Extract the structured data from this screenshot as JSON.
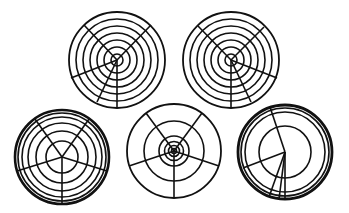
{
  "figure": {
    "stroke_color": "#111111",
    "background": "#ffffff"
  },
  "diagrams": [
    {
      "id": "top-left",
      "cx": 117,
      "cy": 60,
      "rings": [
        {
          "r": 6,
          "w": 1.6
        },
        {
          "r": 13,
          "w": 1.6
        },
        {
          "r": 20,
          "w": 1.6
        },
        {
          "r": 27,
          "w": 1.6
        },
        {
          "r": 34,
          "w": 1.6
        },
        {
          "r": 41,
          "w": 1.6
        },
        {
          "r": 48,
          "w": 1.8
        }
      ],
      "spokes": [
        {
          "x": 84,
          "y": 25
        },
        {
          "x": 151,
          "y": 25
        },
        {
          "x": 71,
          "y": 78
        },
        {
          "x": 97,
          "y": 102
        },
        {
          "x": 117,
          "y": 108
        }
      ],
      "spoke_width": 1.6
    },
    {
      "id": "top-right",
      "cx": 231,
      "cy": 60,
      "rings": [
        {
          "r": 6,
          "w": 1.6
        },
        {
          "r": 13,
          "w": 1.6
        },
        {
          "r": 20,
          "w": 1.6
        },
        {
          "r": 27,
          "w": 1.6
        },
        {
          "r": 34,
          "w": 1.6
        },
        {
          "r": 41,
          "w": 1.6
        },
        {
          "r": 48,
          "w": 1.8
        }
      ],
      "spokes": [
        {
          "x": 198,
          "y": 26
        },
        {
          "x": 264,
          "y": 27
        },
        {
          "x": 277,
          "y": 78
        },
        {
          "x": 251,
          "y": 102
        },
        {
          "x": 231,
          "y": 108
        }
      ],
      "spoke_width": 1.6
    },
    {
      "id": "bottom-left",
      "cx": 62,
      "cy": 157,
      "rings": [
        {
          "r": 16,
          "w": 1.6
        },
        {
          "r": 26,
          "w": 1.6
        },
        {
          "r": 34,
          "w": 1.6
        },
        {
          "r": 40,
          "w": 1.6
        },
        {
          "r": 44,
          "w": 1.6
        },
        {
          "r": 47,
          "w": 2.6
        }
      ],
      "spokes": [
        {
          "x": 35,
          "y": 119
        },
        {
          "x": 89,
          "y": 119
        },
        {
          "x": 107,
          "y": 171
        },
        {
          "x": 62,
          "y": 204
        },
        {
          "x": 17,
          "y": 171
        }
      ],
      "spoke_width": 1.6
    },
    {
      "id": "bottom-middle",
      "cx": 174,
      "cy": 151,
      "rings": [
        {
          "r": 2.5,
          "w": 1.6
        },
        {
          "r": 5.5,
          "w": 1.6
        },
        {
          "r": 9.5,
          "w": 1.6
        },
        {
          "r": 15,
          "w": 1.6
        },
        {
          "r": 30,
          "w": 1.6
        },
        {
          "r": 47,
          "w": 1.8
        }
      ],
      "spokes": [
        {
          "x": 146,
          "y": 113
        },
        {
          "x": 202,
          "y": 113
        },
        {
          "x": 219,
          "y": 166
        },
        {
          "x": 174,
          "y": 198
        },
        {
          "x": 129,
          "y": 166
        }
      ],
      "spoke_width": 1.6
    },
    {
      "id": "bottom-right",
      "cx": 285,
      "cy": 152,
      "rings": [
        {
          "r": 26,
          "w": 1.6
        },
        {
          "r": 40,
          "w": 1.6
        },
        {
          "r": 44,
          "w": 1.6
        },
        {
          "r": 47,
          "w": 2.8
        }
      ],
      "spokes": [
        {
          "x": 270,
          "y": 107
        },
        {
          "x": 243,
          "y": 168
        },
        {
          "x": 269,
          "y": 197
        },
        {
          "x": 279,
          "y": 199
        },
        {
          "x": 285,
          "y": 199
        }
      ],
      "spoke_width": 1.6
    }
  ]
}
